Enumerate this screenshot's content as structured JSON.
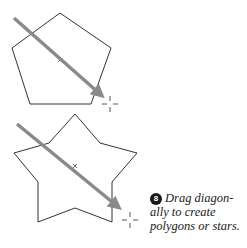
{
  "figure": {
    "colors": {
      "background": "#ffffff",
      "outline": "#333333",
      "arrow": "#8a8a8a",
      "crosshair": "#555555"
    },
    "shapes": [
      {
        "name": "pentagon",
        "points": "60,13 111,48 91,104 30,104 12,48",
        "center": [
          60,
          60
        ],
        "arrow": {
          "x1": 14,
          "y1": 18,
          "x2": 103,
          "y2": 96
        },
        "crosshair": [
          110,
          104
        ]
      },
      {
        "name": "star",
        "points": "75,114 100,143 137,153 112,182 112,222 75,208 38,222 38,182 14,153 49,143",
        "center": [
          75,
          166
        ],
        "arrow": {
          "x1": 17,
          "y1": 124,
          "x2": 120,
          "y2": 209
        },
        "crosshair": [
          130,
          220
        ]
      }
    ],
    "caption": {
      "step_number": "8",
      "line1": "Drag diagon-",
      "line2": "ally to create",
      "line3": "polygons or stars."
    }
  }
}
